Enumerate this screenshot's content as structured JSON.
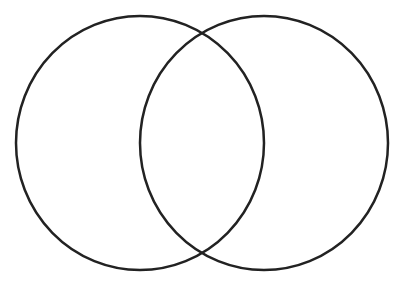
{
  "diagram": {
    "type": "venn",
    "background": "#ffffff",
    "stroke_color": "#222222",
    "stroke_width": 2.5,
    "sets": [
      {
        "name": "left-set",
        "label": "",
        "cx": 140,
        "cy": 143,
        "rx": 124,
        "ry": 127
      },
      {
        "name": "right-set",
        "label": "",
        "cx": 264,
        "cy": 143,
        "rx": 124,
        "ry": 127
      }
    ],
    "intersection_label": ""
  }
}
